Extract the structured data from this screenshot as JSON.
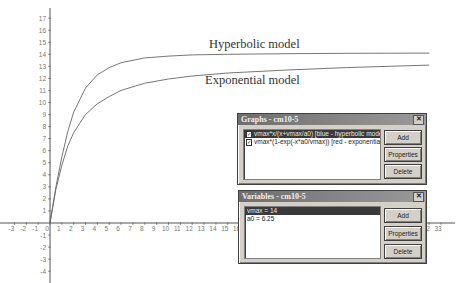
{
  "chart_data": {
    "type": "line",
    "title": "",
    "xlabel": "",
    "ylabel": "",
    "xlim": [
      -3,
      33
    ],
    "ylim": [
      -4,
      17
    ],
    "grid": false,
    "x_ticks": [
      -3,
      -2,
      -1,
      0,
      1,
      2,
      3,
      4,
      5,
      6,
      7,
      8,
      9,
      10,
      11,
      12,
      13,
      14,
      15,
      16,
      32,
      33
    ],
    "y_ticks": [
      -4,
      -3,
      -2,
      -1,
      1,
      2,
      3,
      4,
      5,
      6,
      7,
      8,
      9,
      10,
      11,
      12,
      13,
      14,
      15,
      16,
      17
    ],
    "series": [
      {
        "name": "Hyperbolic model",
        "x": [
          0,
          0.5,
          1,
          1.5,
          2,
          3,
          4,
          5,
          6,
          8,
          10,
          12,
          15,
          20,
          25,
          32
        ],
        "y": [
          0,
          3.0,
          5.5,
          7.6,
          9.2,
          11.2,
          12.3,
          12.9,
          13.3,
          13.7,
          13.85,
          13.95,
          14.0,
          14.05,
          14.08,
          14.1
        ]
      },
      {
        "name": "Exponential model",
        "x": [
          0,
          0.5,
          1,
          1.5,
          2,
          3,
          4,
          5,
          6,
          8,
          10,
          12,
          15,
          20,
          25,
          32
        ],
        "y": [
          0,
          2.8,
          4.8,
          6.4,
          7.5,
          9.0,
          9.9,
          10.5,
          11.0,
          11.6,
          11.95,
          12.2,
          12.45,
          12.7,
          12.9,
          13.1
        ]
      }
    ],
    "annotations": [
      {
        "text": "Hyperbolic model",
        "x": 15.5,
        "y": 14.4
      },
      {
        "text": "Exponential model",
        "x": 15.5,
        "y": 11.4
      }
    ]
  },
  "labels": {
    "hyperbolic": "Hyperbolic model",
    "exponential": "Exponential model"
  },
  "graphs_window": {
    "title": "Graphs - cm10-5",
    "items": [
      {
        "label": "vmax*x/(x+vmax/a0) [blue - hyperbolic model]",
        "checked": true,
        "selected": true
      },
      {
        "label": "vmax*(1-exp(-x*a0/vmax)) [red - exponential model",
        "checked": true,
        "selected": false
      }
    ],
    "buttons": {
      "add": "Add",
      "properties": "Properties",
      "delete": "Delete"
    }
  },
  "variables_window": {
    "title": "Variables - cm10-5",
    "items": [
      {
        "label": "vmax = 14",
        "selected": true
      },
      {
        "label": "a0 = 6.25",
        "selected": false
      }
    ],
    "buttons": {
      "add": "Add",
      "properties": "Properties",
      "delete": "Delete"
    }
  },
  "colors": {
    "axis": "#555555",
    "curve": "#666666",
    "window_title": "#7a7a7a"
  }
}
